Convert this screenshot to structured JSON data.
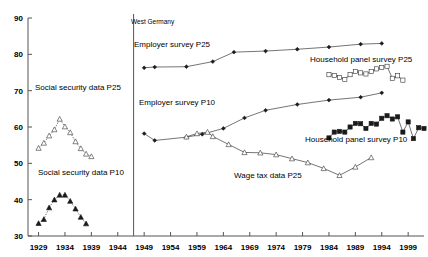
{
  "chart_data": {
    "type": "line",
    "title": "",
    "xlabel": "",
    "ylabel": "",
    "xlim": [
      1927,
      2002
    ],
    "ylim": [
      30,
      90
    ],
    "grid": false,
    "legend": "inline-annotations",
    "xticks": [
      1929,
      1934,
      1939,
      1944,
      1949,
      1954,
      1959,
      1964,
      1969,
      1974,
      1979,
      1984,
      1989,
      1994,
      1999
    ],
    "yticks": [
      30,
      40,
      50,
      60,
      70,
      80,
      90
    ],
    "divider": {
      "x": 1947,
      "label": "West Germany"
    },
    "series": [
      {
        "name": "Social security data P25",
        "marker": "open-triangle",
        "line": "dotted",
        "label": "Social security data P25",
        "points": [
          [
            1929,
            54.2
          ],
          [
            1930,
            55.6
          ],
          [
            1931,
            57.6
          ],
          [
            1932,
            59.3
          ],
          [
            1933,
            62.2
          ],
          [
            1934,
            60.1
          ],
          [
            1935,
            58.5
          ],
          [
            1936,
            56.0
          ],
          [
            1937,
            54.1
          ],
          [
            1938,
            52.6
          ],
          [
            1939,
            51.9
          ]
        ]
      },
      {
        "name": "Social security data P10",
        "marker": "filled-triangle",
        "line": "dotted",
        "label": "Social security data P10",
        "points": [
          [
            1929,
            33.5
          ],
          [
            1930,
            34.6
          ],
          [
            1931,
            37.8
          ],
          [
            1932,
            40.0
          ],
          [
            1933,
            41.3
          ],
          [
            1934,
            41.3
          ],
          [
            1935,
            39.6
          ],
          [
            1936,
            37.5
          ],
          [
            1937,
            35.2
          ],
          [
            1938,
            33.4
          ]
        ]
      },
      {
        "name": "Employer survey P25",
        "marker": "filled-diamond",
        "line": "solid",
        "label": "Employer survey P25",
        "points": [
          [
            1949,
            76.3
          ],
          [
            1951,
            76.5
          ],
          [
            1957,
            76.6
          ],
          [
            1962,
            78.0
          ],
          [
            1966,
            80.6
          ],
          [
            1972,
            80.9
          ],
          [
            1978,
            81.4
          ],
          [
            1984,
            82.0
          ],
          [
            1990,
            82.8
          ],
          [
            1994,
            83.0
          ]
        ]
      },
      {
        "name": "Employer survey P10",
        "marker": "filled-diamond",
        "line": "solid",
        "label": "Employer survey P10",
        "points": [
          [
            1949,
            58.2
          ],
          [
            1951,
            56.3
          ],
          [
            1957,
            57.2
          ],
          [
            1960,
            58.0
          ],
          [
            1964,
            59.6
          ],
          [
            1968,
            62.5
          ],
          [
            1972,
            64.6
          ],
          [
            1978,
            66.2
          ],
          [
            1984,
            67.4
          ],
          [
            1990,
            68.2
          ],
          [
            1994,
            69.4
          ]
        ]
      },
      {
        "name": "Wage tax data P25",
        "marker": "open-triangle",
        "line": "solid",
        "label": "Wage tax data P25",
        "points": [
          [
            1957,
            57.3
          ],
          [
            1959,
            58.2
          ],
          [
            1961,
            58.6
          ],
          [
            1962,
            57.4
          ],
          [
            1965,
            55.2
          ],
          [
            1968,
            53.0
          ],
          [
            1971,
            52.9
          ],
          [
            1974,
            52.4
          ],
          [
            1977,
            51.3
          ],
          [
            1980,
            50.2
          ],
          [
            1983,
            48.6
          ],
          [
            1986,
            46.7
          ],
          [
            1989,
            49.0
          ],
          [
            1992,
            51.6
          ]
        ]
      },
      {
        "name": "Household panel survey P25",
        "marker": "open-square",
        "line": "solid",
        "label": "Household panel survey P25",
        "points": [
          [
            1984,
            74.4
          ],
          [
            1985,
            74.2
          ],
          [
            1986,
            73.6
          ],
          [
            1987,
            73.1
          ],
          [
            1988,
            74.4
          ],
          [
            1989,
            75.3
          ],
          [
            1990,
            74.9
          ],
          [
            1991,
            74.6
          ],
          [
            1992,
            75.3
          ],
          [
            1993,
            76.0
          ],
          [
            1994,
            76.4
          ],
          [
            1995,
            76.7
          ],
          [
            1996,
            73.4
          ],
          [
            1997,
            74.1
          ],
          [
            1998,
            72.9
          ]
        ]
      },
      {
        "name": "Household panel survey P10",
        "marker": "filled-square",
        "line": "solid",
        "label": "Household panel survey P10",
        "points": [
          [
            1984,
            57.0
          ],
          [
            1985,
            58.6
          ],
          [
            1986,
            58.8
          ],
          [
            1987,
            58.6
          ],
          [
            1988,
            60.0
          ],
          [
            1989,
            61.0
          ],
          [
            1990,
            60.9
          ],
          [
            1991,
            59.6
          ],
          [
            1992,
            61.0
          ],
          [
            1993,
            60.8
          ],
          [
            1994,
            62.4
          ],
          [
            1995,
            63.1
          ],
          [
            1996,
            62.2
          ],
          [
            1997,
            62.8
          ],
          [
            1998,
            58.6
          ],
          [
            1999,
            61.4
          ],
          [
            2000,
            56.8
          ],
          [
            2001,
            59.8
          ],
          [
            2002,
            59.6
          ]
        ]
      }
    ],
    "annotations": [
      {
        "id": "ann-west-germany",
        "text": "West Germany",
        "x": 131,
        "y": 24,
        "size": "small"
      },
      {
        "id": "ann-employer-p25",
        "text": "Employer survey P25",
        "x": 134,
        "y": 47,
        "size": "normal"
      },
      {
        "id": "ann-employer-p10",
        "text": "Employer survey P10",
        "x": 139,
        "y": 105,
        "size": "normal"
      },
      {
        "id": "ann-household-p25",
        "text": "Household panel survey P25",
        "x": 310,
        "y": 62,
        "size": "normal"
      },
      {
        "id": "ann-household-p10",
        "text": "Household panel survey P10",
        "x": 305,
        "y": 142,
        "size": "normal"
      },
      {
        "id": "ann-wage-tax-p25",
        "text": "Wage tax data P25",
        "x": 234,
        "y": 178,
        "size": "normal"
      },
      {
        "id": "ann-social-security-p25",
        "text": "Social security data P25",
        "x": 35,
        "y": 90,
        "size": "normal"
      },
      {
        "id": "ann-social-security-p10",
        "text": "Social security data P10",
        "x": 38,
        "y": 175,
        "size": "normal"
      }
    ]
  }
}
